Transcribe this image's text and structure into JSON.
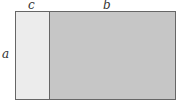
{
  "diagram": {
    "labels": {
      "top_left": "c",
      "top_right": "b",
      "side": "a"
    },
    "colors": {
      "left_fill": "#ececec",
      "right_fill": "#c6c6c6",
      "border": "#666666"
    }
  }
}
